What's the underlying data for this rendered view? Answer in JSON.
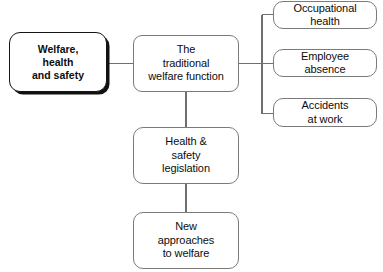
{
  "diagram": {
    "type": "tree",
    "orientation": "left-to-right",
    "colors": {
      "background": "#ffffff",
      "node_fill": "#ffffff",
      "node_border": "#7b7b7b",
      "root_border": "#141414",
      "root_shadow": "#111111",
      "connector": "#6f6f6f",
      "text": "#0d0d0d"
    },
    "nodes": {
      "root": {
        "id": "welfare-health-and-safety",
        "label": "Welfare,\nhealth\nand safety",
        "emphasis": "bold-shadowed"
      },
      "hub": {
        "id": "traditional-welfare-function",
        "label": "The\ntraditional\nwelfare function"
      },
      "branches": [
        {
          "id": "occupational-health",
          "label": "Occupational\nhealth"
        },
        {
          "id": "employee-absence",
          "label": "Employee\nabsence"
        },
        {
          "id": "accidents-at-work",
          "label": "Accidents\nat work"
        }
      ],
      "stack": [
        {
          "id": "health-and-safety-legislation",
          "label": "Health &\nsafety\nlegislation"
        },
        {
          "id": "new-approaches-to-welfare",
          "label": "New\napproaches\nto welfare"
        }
      ]
    },
    "edges": [
      {
        "from": "welfare-health-and-safety",
        "to": "traditional-welfare-function"
      },
      {
        "from": "traditional-welfare-function",
        "to": "occupational-health"
      },
      {
        "from": "traditional-welfare-function",
        "to": "employee-absence"
      },
      {
        "from": "traditional-welfare-function",
        "to": "accidents-at-work"
      },
      {
        "from": "traditional-welfare-function",
        "to": "health-and-safety-legislation"
      },
      {
        "from": "health-and-safety-legislation",
        "to": "new-approaches-to-welfare"
      }
    ]
  }
}
